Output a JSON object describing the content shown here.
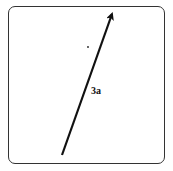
{
  "diagram": {
    "vector": {
      "label": "3a",
      "start": [
        62,
        155
      ],
      "end": [
        113,
        11
      ],
      "color": "#111111"
    },
    "dot": [
      88,
      47
    ],
    "caption": ""
  }
}
